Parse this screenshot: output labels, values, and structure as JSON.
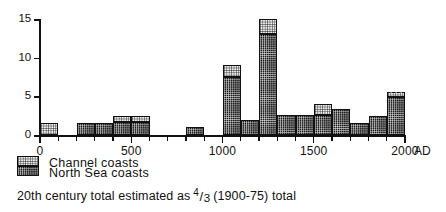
{
  "chart_data": {
    "type": "bar",
    "title": "",
    "subtitle": "",
    "xlabel": "AD",
    "ylabel": "",
    "xlim": [
      0,
      2000
    ],
    "ylim": [
      0,
      15
    ],
    "grid": false,
    "legend_position": "below-left",
    "bin_width": 100,
    "x_major_ticks": [
      0,
      500,
      1000,
      1500,
      2000
    ],
    "x_major_tick_labels": [
      "0",
      "500",
      "1000",
      "1500",
      "2000"
    ],
    "x_minor_tick_step": 100,
    "y_ticks": [
      0,
      5,
      10,
      15
    ],
    "y_tick_labels": [
      "0",
      "5",
      "10",
      "15"
    ],
    "x_axis_suffix": "AD",
    "stacked": true,
    "series": [
      {
        "name": "North Sea coasts",
        "fill": "dark-checker",
        "color": "#1b1b1b",
        "values": [
          0,
          1.5,
          1.5,
          1.5,
          1.5,
          1.7,
          0,
          0,
          1,
          0,
          7.5,
          2,
          13,
          2.6,
          2.6,
          2.6,
          3.4,
          1.6,
          1.6,
          4.9
        ]
      },
      {
        "name": "Channel coasts",
        "fill": "light-stipple",
        "color": "#f2f2f2",
        "values": [
          1.5,
          0,
          0,
          0,
          0,
          0.8,
          0,
          0,
          0,
          0,
          1.5,
          0,
          2,
          0,
          0,
          1.4,
          0,
          0,
          0,
          0.6
        ]
      }
    ],
    "bins": [
      {
        "from": 0,
        "to": 100,
        "north_sea": 0,
        "channel": 1.5,
        "total": 1.5
      },
      {
        "from": 100,
        "to": 200,
        "north_sea": 0,
        "channel": 0,
        "total": 0
      },
      {
        "from": 200,
        "to": 300,
        "north_sea": 1.5,
        "channel": 0,
        "total": 1.5
      },
      {
        "from": 300,
        "to": 400,
        "north_sea": 1.5,
        "channel": 0,
        "total": 1.5
      },
      {
        "from": 400,
        "to": 500,
        "north_sea": 1.7,
        "channel": 0.8,
        "total": 2.5
      },
      {
        "from": 500,
        "to": 600,
        "north_sea": 1.7,
        "channel": 0.8,
        "total": 2.5
      },
      {
        "from": 600,
        "to": 700,
        "north_sea": 0,
        "channel": 0,
        "total": 0
      },
      {
        "from": 700,
        "to": 800,
        "north_sea": 0,
        "channel": 0,
        "total": 0
      },
      {
        "from": 800,
        "to": 900,
        "north_sea": 1.1,
        "channel": 0,
        "total": 1.1
      },
      {
        "from": 900,
        "to": 1000,
        "north_sea": 0,
        "channel": 0,
        "total": 0
      },
      {
        "from": 1000,
        "to": 1100,
        "north_sea": 7.5,
        "channel": 1.5,
        "total": 9.0
      },
      {
        "from": 1100,
        "to": 1200,
        "north_sea": 2.0,
        "channel": 0,
        "total": 2.0
      },
      {
        "from": 1200,
        "to": 1300,
        "north_sea": 13.0,
        "channel": 2.0,
        "total": 15.0
      },
      {
        "from": 1300,
        "to": 1400,
        "north_sea": 2.6,
        "channel": 0,
        "total": 2.6
      },
      {
        "from": 1400,
        "to": 1500,
        "north_sea": 2.6,
        "channel": 0,
        "total": 2.6
      },
      {
        "from": 1500,
        "to": 1600,
        "north_sea": 2.6,
        "channel": 1.4,
        "total": 4.0
      },
      {
        "from": 1600,
        "to": 1700,
        "north_sea": 3.4,
        "channel": 0,
        "total": 3.4
      },
      {
        "from": 1700,
        "to": 1800,
        "north_sea": 1.6,
        "channel": 0,
        "total": 1.6
      },
      {
        "from": 1800,
        "to": 1900,
        "north_sea": 2.4,
        "channel": 0,
        "total": 2.4
      },
      {
        "from": 1900,
        "to": 2000,
        "north_sea": 4.9,
        "channel": 0.6,
        "total": 5.5,
        "estimated": true
      }
    ],
    "annotations": [
      {
        "text": "20th century total estimated as 4/3 (1900-75) total",
        "target_bin": "1900-2000"
      }
    ]
  },
  "legend": {
    "items": [
      {
        "label": "Channel coasts",
        "swatch": "light-stipple"
      },
      {
        "label": "North Sea coasts",
        "swatch": "dark-checker"
      }
    ]
  },
  "caption": {
    "prefix": "20th century  total  estimated  as",
    "fraction_numerator": "4",
    "fraction_slash": "/",
    "fraction_denominator": "3",
    "suffix": "(1900-75) total"
  },
  "axes": {
    "y_labels": [
      "15",
      "10",
      "5",
      "0"
    ],
    "x_labels": [
      "0",
      "500",
      "1000",
      "1500",
      "2000"
    ],
    "x_suffix": "AD"
  }
}
